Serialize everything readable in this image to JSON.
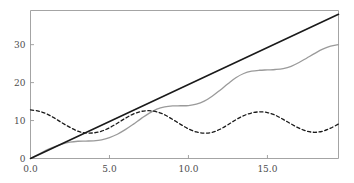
{
  "chart_data": {
    "type": "line",
    "title": "",
    "subtitle": "",
    "xlabel": "",
    "ylabel": "",
    "xlim": [
      0.0,
      19.5
    ],
    "ylim": [
      0.0,
      39.0
    ],
    "grid": false,
    "legend": "none",
    "xticks": [
      0.0,
      5.0,
      10.0,
      15.0
    ],
    "xtick_labels": [
      "0.0",
      "5.0",
      "10.0",
      "15.0"
    ],
    "yticks": [
      0,
      10,
      20,
      30
    ],
    "ytick_labels": [
      "0",
      "10",
      "20",
      "30"
    ],
    "series": [
      {
        "name": "linear-reference",
        "style": "solid",
        "color": "#1a1a1a",
        "width": 1.6,
        "x": [
          0.0,
          1.0,
          2.0,
          3.0,
          4.0,
          5.0,
          6.0,
          7.0,
          8.0,
          9.0,
          10.0,
          11.0,
          12.0,
          13.0,
          14.0,
          15.0,
          16.0,
          17.0,
          18.0,
          19.0,
          19.5
        ],
        "values": [
          0.0,
          1.95,
          3.9,
          5.85,
          7.8,
          9.75,
          11.7,
          13.65,
          15.6,
          17.55,
          19.5,
          21.45,
          23.4,
          25.35,
          27.3,
          29.25,
          31.2,
          33.15,
          35.1,
          37.05,
          38.0
        ]
      },
      {
        "name": "oscillating-growth",
        "style": "solid",
        "color": "#9a9a9a",
        "width": 1.3,
        "x": [
          0.0,
          0.5,
          1.0,
          1.5,
          2.0,
          2.5,
          3.0,
          3.5,
          4.0,
          4.5,
          5.0,
          5.5,
          6.0,
          6.5,
          7.0,
          7.5,
          8.0,
          8.5,
          9.0,
          9.5,
          10.0,
          10.5,
          11.0,
          11.5,
          12.0,
          12.5,
          13.0,
          13.5,
          14.0,
          14.5,
          15.0,
          15.5,
          16.0,
          16.5,
          17.0,
          17.5,
          18.0,
          18.5,
          19.0,
          19.5
        ],
        "values": [
          0.0,
          1.1,
          2.2,
          3.1,
          3.8,
          4.3,
          4.55,
          4.6,
          4.65,
          4.9,
          5.5,
          6.4,
          7.6,
          9.0,
          10.5,
          11.9,
          13.0,
          13.6,
          13.85,
          13.9,
          13.95,
          14.3,
          15.1,
          16.4,
          18.0,
          19.7,
          21.3,
          22.4,
          23.0,
          23.25,
          23.35,
          23.45,
          23.7,
          24.3,
          25.3,
          26.5,
          27.7,
          28.8,
          29.6,
          30.0
        ]
      },
      {
        "name": "damped-oscillation",
        "style": "dashed",
        "color": "#1a1a1a",
        "width": 1.3,
        "x": [
          0.0,
          0.5,
          1.0,
          1.5,
          2.0,
          2.5,
          3.0,
          3.5,
          4.0,
          4.5,
          5.0,
          5.5,
          6.0,
          6.5,
          7.0,
          7.5,
          8.0,
          8.5,
          9.0,
          9.5,
          10.0,
          10.5,
          11.0,
          11.5,
          12.0,
          12.5,
          13.0,
          13.5,
          14.0,
          14.5,
          15.0,
          15.5,
          16.0,
          16.5,
          17.0,
          17.5,
          18.0,
          18.5,
          19.0,
          19.5
        ],
        "values": [
          12.8,
          12.5,
          11.8,
          10.7,
          9.4,
          8.2,
          7.2,
          6.75,
          6.75,
          7.2,
          8.1,
          9.3,
          10.6,
          11.7,
          12.4,
          12.6,
          12.3,
          11.5,
          10.3,
          9.0,
          7.8,
          7.0,
          6.7,
          6.9,
          7.7,
          8.9,
          10.2,
          11.3,
          12.0,
          12.3,
          12.1,
          11.4,
          10.3,
          9.1,
          8.0,
          7.2,
          6.9,
          7.2,
          8.0,
          9.1
        ]
      }
    ]
  },
  "axes": {
    "spine_color": "#9a9a9a",
    "tick_color": "#9a9a9a",
    "label_color": "#4d4d4d",
    "background": "#ffffff"
  }
}
